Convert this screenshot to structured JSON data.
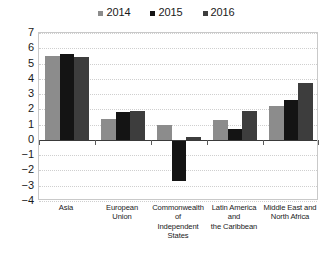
{
  "chart_data": {
    "type": "bar",
    "title": "",
    "subtitle": "",
    "xlabel": "",
    "ylabel": "",
    "ylim": [
      -4,
      7
    ],
    "ytick_step": 1,
    "yticks": [
      "7",
      "6",
      "5",
      "4",
      "3",
      "2",
      "1",
      "0",
      "−1",
      "−2",
      "−3",
      "−4"
    ],
    "grid": true,
    "legend_position": "top-center",
    "categories": [
      "Asia",
      "European\nUnion",
      "Commonwealth\nof\nIndependent\nStates",
      "Latin America\nand\nthe Caribbean",
      "Middle East and\nNorth Africa"
    ],
    "series": [
      {
        "name": "2014",
        "color": "#8c8c8c",
        "values": [
          5.5,
          1.4,
          1.0,
          1.3,
          2.2
        ]
      },
      {
        "name": "2015",
        "color": "#141414",
        "values": [
          5.6,
          1.8,
          -2.7,
          0.7,
          2.6
        ]
      },
      {
        "name": "2016",
        "color": "#3d3d3d",
        "values": [
          5.4,
          1.9,
          0.2,
          1.9,
          3.7
        ]
      }
    ]
  },
  "legend": {
    "items": [
      {
        "label": "2014",
        "color": "#8c8c8c"
      },
      {
        "label": "2015",
        "color": "#141414"
      },
      {
        "label": "2016",
        "color": "#3d3d3d"
      }
    ]
  },
  "axis": {
    "zero_line_color": "#3a3a3a",
    "grid_color": "#cfcfcf",
    "frame_color": "#c9c9c9"
  }
}
